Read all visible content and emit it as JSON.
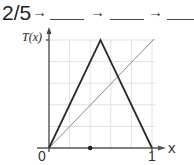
{
  "sequence": {
    "start_value": "2/5",
    "arrow_glyph": "→",
    "blanks": [
      "",
      "",
      ""
    ]
  },
  "axes": {
    "y_label": "T(x)",
    "x_label": "x",
    "x_tick_0": "0",
    "x_tick_1": "1"
  },
  "graph": {
    "functions": [
      {
        "name": "tent map T(x)",
        "points": [
          [
            0,
            0
          ],
          [
            0.5,
            1
          ],
          [
            1,
            0
          ]
        ],
        "color": "#333333"
      },
      {
        "name": "y = x",
        "points": [
          [
            0,
            0
          ],
          [
            1,
            1
          ]
        ],
        "color": "#888888"
      }
    ],
    "marked_point": {
      "x": 0.4,
      "label": "2/5"
    },
    "grid_divisions": 5
  }
}
